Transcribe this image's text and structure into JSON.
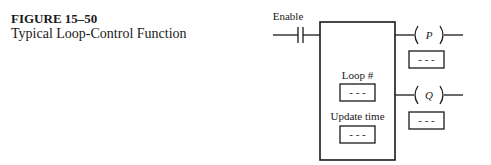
{
  "caption": {
    "figure_label": "FIGURE 15–50",
    "title": "Typical Loop-Control Function"
  },
  "diagram": {
    "input_contact": {
      "label": "Enable"
    },
    "function_block": {
      "fields": [
        {
          "label": "Loop #",
          "value": "- - -"
        },
        {
          "label": "Update time",
          "value": "- - -"
        }
      ]
    },
    "outputs": [
      {
        "coil": "P",
        "value": "- - -"
      },
      {
        "coil": "Q",
        "value": "- - -"
      }
    ]
  }
}
